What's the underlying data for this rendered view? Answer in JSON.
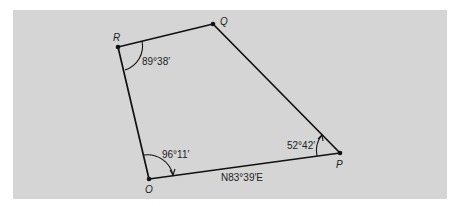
{
  "figure": {
    "background_color": "#d5d5d5",
    "line_color": "#111111",
    "vertices": [
      {
        "id": "R",
        "label": "R"
      },
      {
        "id": "Q",
        "label": "Q"
      },
      {
        "id": "P",
        "label": "P"
      },
      {
        "id": "O",
        "label": "O"
      }
    ],
    "edges": [
      {
        "from": "R",
        "to": "Q"
      },
      {
        "from": "Q",
        "to": "P"
      },
      {
        "from": "P",
        "to": "O"
      },
      {
        "from": "O",
        "to": "R"
      }
    ],
    "angles": [
      {
        "vertex": "R",
        "label": "89°38′"
      },
      {
        "vertex": "O",
        "label": "96°11′"
      },
      {
        "vertex": "P",
        "label": "52°42′"
      }
    ],
    "bearing": {
      "edge": "O-P",
      "label": "N83°39′E"
    }
  }
}
